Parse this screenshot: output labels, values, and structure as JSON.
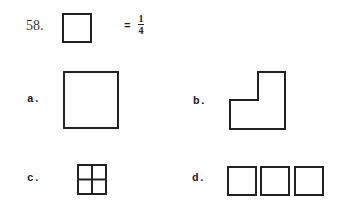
{
  "question": {
    "number": "58.",
    "given_shape": "small-square",
    "equals_sign": "=",
    "value": {
      "numerator": "1",
      "denominator": "4"
    }
  },
  "options": [
    {
      "label": "a.",
      "shape": "large-square"
    },
    {
      "label": "b.",
      "shape": "l-shape"
    },
    {
      "label": "c.",
      "shape": "square-divided-into-four"
    },
    {
      "label": "d.",
      "shape": "three-squares-in-row"
    }
  ],
  "colors": {
    "ink": "#222222",
    "paper": "#ffffff"
  }
}
